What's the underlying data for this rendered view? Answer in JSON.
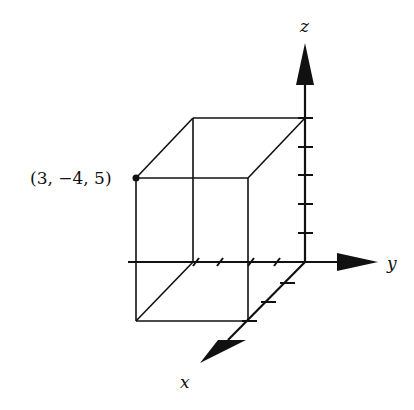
{
  "diagram": {
    "type": "3d-coordinate-axes-with-box",
    "axes": {
      "x_label": "x",
      "y_label": "y",
      "z_label": "z",
      "x_ticks": 3,
      "y_ticks": 4,
      "z_ticks": 5
    },
    "point": {
      "label": "(3, −4, 5)",
      "coords": [
        3,
        -4,
        5
      ]
    },
    "colors": {
      "stroke": "#111111",
      "background": "#ffffff"
    }
  }
}
